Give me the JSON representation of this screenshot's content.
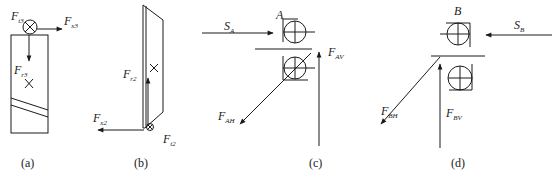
{
  "panels": {
    "a": {
      "caption": "(a)",
      "labels": {
        "Ft3": {
          "main": "F",
          "sub": "t3"
        },
        "Fx3": {
          "main": "F",
          "sub": "x3"
        },
        "Fr3": {
          "main": "F",
          "sub": "r3"
        }
      }
    },
    "b": {
      "caption": "(b)",
      "labels": {
        "Fr2": {
          "main": "F",
          "sub": "r2"
        },
        "Fx2": {
          "main": "F",
          "sub": "x2"
        },
        "Ft2": {
          "main": "F",
          "sub": "t2"
        }
      }
    },
    "c": {
      "caption": "(c)",
      "labels": {
        "SA": {
          "main": "S",
          "sub": "A"
        },
        "A": "A",
        "FAV": {
          "main": "F",
          "sub": "AV"
        },
        "FAH": {
          "main": "F",
          "sub": "AH"
        }
      }
    },
    "d": {
      "caption": "(d)",
      "labels": {
        "B": "B",
        "SB": {
          "main": "S",
          "sub": "B"
        },
        "FBH": {
          "main": "F",
          "sub": "BH"
        },
        "FBV": {
          "main": "F",
          "sub": "BV"
        }
      }
    }
  },
  "colors": {
    "line": "#1a1a1a",
    "background": "#ffffff"
  }
}
